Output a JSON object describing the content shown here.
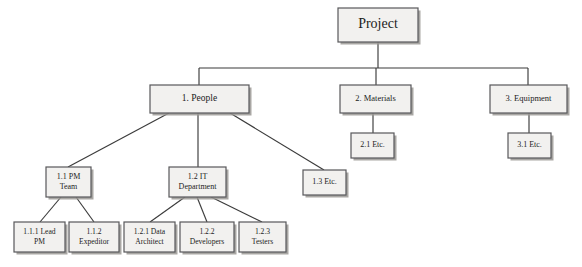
{
  "diagram": {
    "type": "tree",
    "background_color": "#ffffff",
    "node_fill_color": "#f2f1ef",
    "node_border_color": "#58585a",
    "node_shadow_color": "#9a9894",
    "connector_color": "#3b3b3b",
    "text_color": "#1c1c1c",
    "nodes": [
      {
        "id": "project",
        "label": "Project",
        "lines": [
          "Project"
        ],
        "x": 338,
        "y": 8,
        "w": 80,
        "h": 34,
        "font_size": 14,
        "level": 0
      },
      {
        "id": "people",
        "label": "1. People",
        "lines": [
          "1. People"
        ],
        "x": 150,
        "y": 85,
        "w": 99,
        "h": 28,
        "font_size": 9.5,
        "level": 1
      },
      {
        "id": "materials",
        "label": "2. Materials",
        "lines": [
          "2. Materials"
        ],
        "x": 340,
        "y": 85,
        "w": 71,
        "h": 28,
        "font_size": 8.5,
        "level": 1
      },
      {
        "id": "equipment",
        "label": "3. Equipment",
        "lines": [
          "3. Equipment"
        ],
        "x": 490,
        "y": 85,
        "w": 77,
        "h": 28,
        "font_size": 8.5,
        "level": 1
      },
      {
        "id": "mat-etc",
        "label": "2.1 Etc.",
        "lines": [
          "2.1 Etc."
        ],
        "x": 351,
        "y": 133,
        "w": 43,
        "h": 25,
        "font_size": 8,
        "level": 2
      },
      {
        "id": "equip-etc",
        "label": "3.1 Etc.",
        "lines": [
          "3.1 Etc."
        ],
        "x": 508,
        "y": 133,
        "w": 43,
        "h": 25,
        "font_size": 8,
        "level": 2
      },
      {
        "id": "pm-team",
        "label": "1.1 PM Team",
        "lines": [
          "1.1 PM",
          "Team"
        ],
        "x": 46,
        "y": 167,
        "w": 45,
        "h": 30,
        "font_size": 8,
        "level": 2
      },
      {
        "id": "it-dept",
        "label": "1.2 IT Department",
        "lines": [
          "1.2 IT",
          "Department"
        ],
        "x": 169,
        "y": 167,
        "w": 57,
        "h": 30,
        "font_size": 8,
        "level": 2
      },
      {
        "id": "people-etc",
        "label": "1.3 Etc.",
        "lines": [
          "1.3 Etc."
        ],
        "x": 303,
        "y": 170,
        "w": 43,
        "h": 25,
        "font_size": 8,
        "level": 2
      },
      {
        "id": "lead-pm",
        "label": "1.1.1 Lead PM",
        "lines": [
          "1.1.1 Lead",
          "PM"
        ],
        "x": 14,
        "y": 222,
        "w": 51,
        "h": 30,
        "font_size": 7.6,
        "level": 3
      },
      {
        "id": "expeditor",
        "label": "1.1.2 Expeditor",
        "lines": [
          "1.1.2",
          "Expeditor"
        ],
        "x": 69,
        "y": 222,
        "w": 50,
        "h": 30,
        "font_size": 7.6,
        "level": 3
      },
      {
        "id": "data-arch",
        "label": "1.2.1 Data Architect",
        "lines": [
          "1.2.1 Data",
          "Architect"
        ],
        "x": 124,
        "y": 222,
        "w": 51,
        "h": 30,
        "font_size": 7.6,
        "level": 3
      },
      {
        "id": "developers",
        "label": "1.2.2 Developers",
        "lines": [
          "1.2.2",
          "Developers"
        ],
        "x": 180,
        "y": 222,
        "w": 54,
        "h": 30,
        "font_size": 7.6,
        "level": 3
      },
      {
        "id": "testers",
        "label": "1.2.3 Testers",
        "lines": [
          "1.2.3",
          "Testers"
        ],
        "x": 239,
        "y": 222,
        "w": 47,
        "h": 30,
        "font_size": 7.6,
        "level": 3
      }
    ],
    "connectors": [
      {
        "id": "project-bus-stem",
        "from": "project",
        "to": "bus",
        "points": "378,42 378,68"
      },
      {
        "id": "bus-horizontal",
        "from": "bus",
        "to": "bus",
        "points": "199,68 528,68"
      },
      {
        "id": "bus-to-people",
        "from": "bus",
        "to": "people",
        "points": "199,68 199,85"
      },
      {
        "id": "bus-to-materials",
        "from": "bus",
        "to": "materials",
        "points": "376,68 376,85"
      },
      {
        "id": "bus-to-equipment",
        "from": "bus",
        "to": "equipment",
        "points": "528,68 528,85"
      },
      {
        "id": "materials-to-etc",
        "from": "materials",
        "to": "mat-etc",
        "points": "373,113 373,133"
      },
      {
        "id": "equipment-to-etc",
        "from": "equipment",
        "to": "equip-etc",
        "points": "529,113 529,133"
      },
      {
        "id": "people-to-pm-team",
        "from": "people",
        "to": "pm-team",
        "points": "169,113 68,167"
      },
      {
        "id": "people-to-it-dept",
        "from": "people",
        "to": "it-dept",
        "points": "198,113 198,167"
      },
      {
        "id": "people-to-etc",
        "from": "people",
        "to": "people-etc",
        "points": "230,113 324,170"
      },
      {
        "id": "pm-team-to-lead-pm",
        "from": "pm-team",
        "to": "lead-pm",
        "points": "61,197 40,222"
      },
      {
        "id": "pm-team-to-expeditor",
        "from": "pm-team",
        "to": "expeditor",
        "points": "76,197 94,222"
      },
      {
        "id": "it-dept-to-data-arch",
        "from": "it-dept",
        "to": "data-arch",
        "points": "185,197 150,222"
      },
      {
        "id": "it-dept-to-developers",
        "from": "it-dept",
        "to": "developers",
        "points": "197,197 207,222"
      },
      {
        "id": "it-dept-to-testers",
        "from": "it-dept",
        "to": "testers",
        "points": "211,197 262,222"
      }
    ]
  }
}
